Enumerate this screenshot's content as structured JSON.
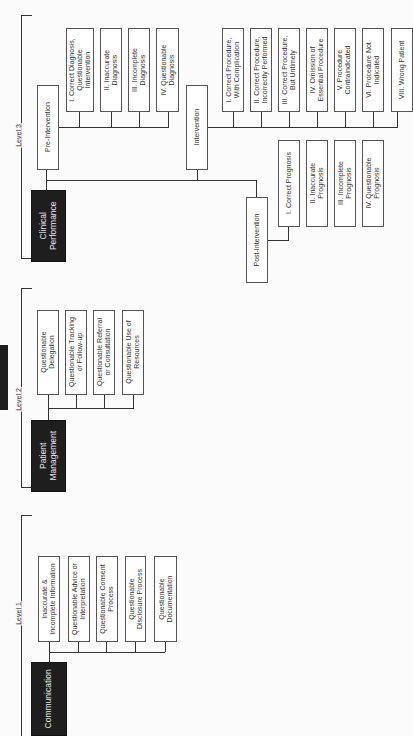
{
  "levels": [
    {
      "label": "Level 1",
      "root": "Communication",
      "items": [
        "Inaccurate &\nIncomplete Information",
        "Questionable Advice or\nInterpretation",
        "Questionable Consent\nProcess",
        "Questionable\nDisclosure Process",
        "Questionable\nDocumentation"
      ]
    },
    {
      "label": "Level 2",
      "root": "Patient\nManagement",
      "items": [
        "Questionable\nDelegation",
        "Questionable Tracking\nor Follow-up",
        "Questionable Referral\nor Consultation",
        "Questionable Use of\nResources"
      ]
    },
    {
      "label": "Level 3",
      "root": "Clinical\nPerformance",
      "phases": [
        {
          "label": "Pre-Intervention",
          "items": [
            "I. Correct Diagnosis,\nQuestionable\nIntervention",
            "II. Inaccurate\nDiagnosis",
            "III. Incomplete\nDiagnosis",
            "IV. Questionable\nDiagnosis"
          ]
        },
        {
          "label": "Intervention",
          "items": [
            "I. Correct Procedure,\nWith Complication",
            "II. Correct Procedure,\nIncorrectly Performed",
            "III. Correct Procedure,\nBut Untimely",
            "IV. Omission of\nEssential Procedure",
            "V. Procedure\nContraindicated",
            "VI. Procedure Not\nIndicated",
            "VIII. Wrong Patient"
          ]
        },
        {
          "label": "Post-Intervention",
          "items": [
            "I. Correct Prognosis",
            "II. Inaccurate\nPrognosis",
            "III. Incomplete\nPrognosis",
            "IV. Questionable\nPrognosis"
          ]
        }
      ]
    }
  ]
}
